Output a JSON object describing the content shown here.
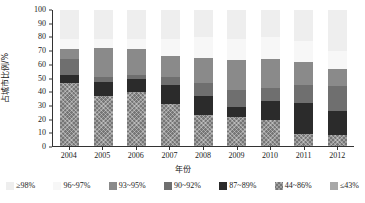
{
  "chart_data": {
    "type": "bar",
    "stacked": true,
    "title": "",
    "xlabel": "年份",
    "ylabel": "占城市比例/%",
    "ylim": [
      0,
      100
    ],
    "ytick_step": 10,
    "yticks": [
      "100",
      "90",
      "80",
      "70",
      "60",
      "50",
      "40",
      "30",
      "20",
      "10",
      "0"
    ],
    "grid": false,
    "legend_position": "bottom",
    "categories": [
      "2004",
      "2005",
      "2006",
      "2007",
      "2008",
      "2009",
      "2010",
      "2011",
      "2012"
    ],
    "series": [
      {
        "name": "≥98%",
        "color": "#eeeeee",
        "values": [
          21,
          28,
          29,
          34,
          35,
          37,
          36,
          38,
          30
        ]
      },
      {
        "name": "96~97%",
        "color": "#f7f7f7",
        "values": [
          8,
          0,
          0,
          0,
          0,
          0,
          0,
          0,
          13
        ]
      },
      {
        "name": "93~95%",
        "color": "#8a8a8a",
        "values": [
          19,
          25,
          22,
          21,
          28,
          34,
          31,
          30,
          13
        ]
      },
      {
        "name": "90~92%",
        "color": "#6f6f6f",
        "values": [
          6,
          10,
          9,
          14,
          0,
          0,
          0,
          22,
          18
        ]
      },
      {
        "name": "87~89%",
        "color": "#2b2b2b",
        "values": [
          6,
          10,
          9,
          14,
          14,
          8,
          14,
          23,
          18
        ]
      },
      {
        "name": "44~86%",
        "color": "#767676",
        "values": [
          46,
          37,
          40,
          31,
          23,
          21,
          19,
          9,
          8
        ]
      },
      {
        "name": "≤43%",
        "color": "#a8a8a8",
        "values": [
          0,
          0,
          0,
          0,
          0,
          0,
          0,
          0,
          0
        ]
      }
    ],
    "bar_stacks": [
      {
        "year": "2004",
        "segments": [
          {
            "series": "44~86%",
            "value": 46
          },
          {
            "series": "87~89%",
            "value": 6
          },
          {
            "series": "90~92%",
            "value": 12
          },
          {
            "series": "93~95%",
            "value": 7
          },
          {
            "series": "96~97%",
            "value": 8
          },
          {
            "series": "≥98%",
            "value": 21
          }
        ]
      },
      {
        "year": "2005",
        "segments": [
          {
            "series": "44~86%",
            "value": 37
          },
          {
            "series": "87~89%",
            "value": 10
          },
          {
            "series": "90~92%",
            "value": 4
          },
          {
            "series": "93~95%",
            "value": 21
          },
          {
            "series": "96~97%",
            "value": 7
          },
          {
            "series": "≥98%",
            "value": 21
          }
        ]
      },
      {
        "year": "2006",
        "segments": [
          {
            "series": "44~86%",
            "value": 40
          },
          {
            "series": "87~89%",
            "value": 9
          },
          {
            "series": "90~92%",
            "value": 3
          },
          {
            "series": "93~95%",
            "value": 19
          },
          {
            "series": "96~97%",
            "value": 8
          },
          {
            "series": "≥98%",
            "value": 21
          }
        ]
      },
      {
        "year": "2007",
        "segments": [
          {
            "series": "44~86%",
            "value": 31
          },
          {
            "series": "87~89%",
            "value": 14
          },
          {
            "series": "90~92%",
            "value": 6
          },
          {
            "series": "93~95%",
            "value": 15
          },
          {
            "series": "96~97%",
            "value": 13
          },
          {
            "series": "≥98%",
            "value": 21
          }
        ]
      },
      {
        "year": "2008",
        "segments": [
          {
            "series": "44~86%",
            "value": 23
          },
          {
            "series": "87~89%",
            "value": 14
          },
          {
            "series": "90~92%",
            "value": 9
          },
          {
            "series": "93~95%",
            "value": 19
          },
          {
            "series": "96~97%",
            "value": 15
          },
          {
            "series": "≥98%",
            "value": 20
          }
        ]
      },
      {
        "year": "2009",
        "segments": [
          {
            "series": "44~86%",
            "value": 21
          },
          {
            "series": "87~89%",
            "value": 8
          },
          {
            "series": "90~92%",
            "value": 12
          },
          {
            "series": "93~95%",
            "value": 22
          },
          {
            "series": "96~97%",
            "value": 16
          },
          {
            "series": "≥98%",
            "value": 21
          }
        ]
      },
      {
        "year": "2010",
        "segments": [
          {
            "series": "44~86%",
            "value": 19
          },
          {
            "series": "87~89%",
            "value": 14
          },
          {
            "series": "90~92%",
            "value": 10
          },
          {
            "series": "93~95%",
            "value": 21
          },
          {
            "series": "96~97%",
            "value": 16
          },
          {
            "series": "≥98%",
            "value": 20
          }
        ]
      },
      {
        "year": "2011",
        "segments": [
          {
            "series": "44~86%",
            "value": 9
          },
          {
            "series": "87~89%",
            "value": 23
          },
          {
            "series": "90~92%",
            "value": 13
          },
          {
            "series": "93~95%",
            "value": 17
          },
          {
            "series": "96~97%",
            "value": 15
          },
          {
            "series": "≥98%",
            "value": 23
          }
        ]
      },
      {
        "year": "2012",
        "segments": [
          {
            "series": "44~86%",
            "value": 8
          },
          {
            "series": "87~89%",
            "value": 18
          },
          {
            "series": "90~92%",
            "value": 18
          },
          {
            "series": "93~95%",
            "value": 13
          },
          {
            "series": "96~97%",
            "value": 13
          },
          {
            "series": "≥98%",
            "value": 30
          }
        ]
      }
    ]
  },
  "axes": {
    "y_title": "占城市比例/%",
    "x_title": "年份",
    "y_ticks": [
      "100",
      "90",
      "80",
      "70",
      "60",
      "50",
      "40",
      "30",
      "20",
      "10",
      "0"
    ],
    "x_ticks": [
      "2004",
      "2005",
      "2006",
      "2007",
      "2008",
      "2009",
      "2010",
      "2011",
      "2012"
    ]
  },
  "legend": {
    "items": [
      {
        "label": "≥98%",
        "color": "#eeeeee",
        "key": "ge98"
      },
      {
        "label": "96~97%",
        "color": "#f7f7f7",
        "key": "96-97"
      },
      {
        "label": "93~95%",
        "color": "#8a8a8a",
        "key": "93-95"
      },
      {
        "label": "90~92%",
        "color": "#6f6f6f",
        "key": "90-92"
      },
      {
        "label": "87~89%",
        "color": "#2b2b2b",
        "key": "87-89"
      },
      {
        "label": "44~86%",
        "color": "#767676",
        "key": "44-86"
      },
      {
        "label": "≤43%",
        "color": "#a8a8a8",
        "key": "le43"
      }
    ]
  }
}
